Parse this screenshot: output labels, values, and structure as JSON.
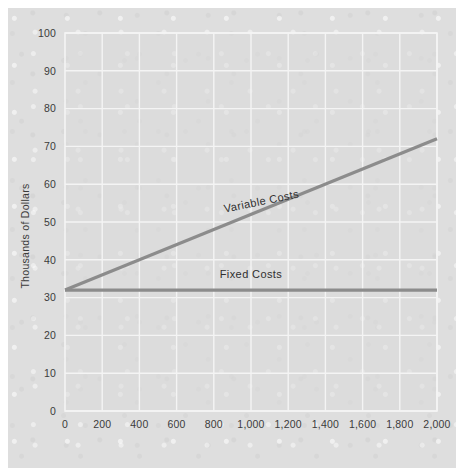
{
  "chart_data": {
    "type": "line",
    "title": "",
    "xlabel": "",
    "ylabel": "Thousands of Dollars",
    "xlim": [
      0,
      2000
    ],
    "ylim": [
      0,
      100
    ],
    "grid": true,
    "legend": "inline-labels",
    "x_ticks": [
      0,
      200,
      400,
      600,
      800,
      1000,
      1200,
      1400,
      1600,
      1800,
      2000
    ],
    "x_tick_labels": [
      "0",
      "200",
      "400",
      "600",
      "800",
      "1,000",
      "1,200",
      "1,400",
      "1,600",
      "1,800",
      "2,000"
    ],
    "y_ticks": [
      0,
      10,
      20,
      30,
      40,
      50,
      60,
      70,
      80,
      90,
      100
    ],
    "y_tick_labels": [
      "0",
      "10",
      "20",
      "30",
      "40",
      "50",
      "60",
      "70",
      "80",
      "90",
      "100"
    ],
    "series": [
      {
        "name": "Variable Costs",
        "label": "Variable Costs",
        "color": "#8c8c8c",
        "points": [
          [
            0,
            32
          ],
          [
            2000,
            72
          ]
        ],
        "label_x": 1060,
        "label_y": 54.5,
        "label_rotation": -11.5
      },
      {
        "name": "Fixed Costs",
        "label": "Fixed Costs",
        "color": "#8c8c8c",
        "points": [
          [
            0,
            32
          ],
          [
            2000,
            32
          ]
        ],
        "label_x": 1000,
        "label_y": 35.2,
        "label_rotation": 0
      }
    ]
  },
  "style": {
    "page_background": "#ffffff",
    "paper_color": "#dedede",
    "plot_background": "#dcdcdc",
    "gridline_color": "#f2f2f2",
    "line_color": "#8c8c8c",
    "text_color": "#3b3b3b"
  }
}
